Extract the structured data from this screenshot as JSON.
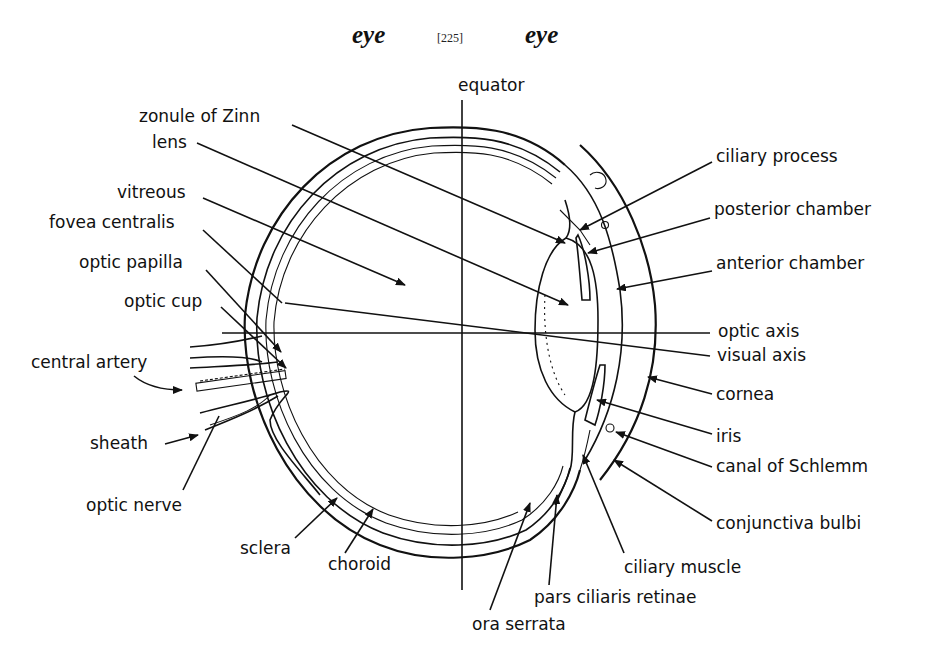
{
  "header": {
    "left_word": "eye",
    "page_number": "[225]",
    "right_word": "eye"
  },
  "diagram": {
    "title_axis_label": "equator",
    "labels_left": {
      "zonule_of_zinn": "zonule of Zinn",
      "lens": "lens",
      "vitreous": "vitreous",
      "fovea_centralis": "fovea centralis",
      "optic_papilla": "optic papilla",
      "optic_cup": "optic cup",
      "central_artery": "central artery",
      "sheath": "sheath",
      "optic_nerve": "optic nerve"
    },
    "labels_bottom": {
      "sclera": "sclera",
      "choroid": "choroid",
      "ora_serrata": "ora serrata",
      "pars_ciliaris_retinae": "pars ciliaris retinae",
      "ciliary_muscle": "ciliary muscle"
    },
    "labels_right": {
      "ciliary_process": "ciliary process",
      "posterior_chamber": "posterior chamber",
      "anterior_chamber": "anterior chamber",
      "optic_axis": "optic axis",
      "visual_axis": "visual axis",
      "cornea": "cornea",
      "iris": "iris",
      "canal_of_schlemm": "canal of Schlemm",
      "conjunctiva_bulbi": "conjunctiva bulbi"
    },
    "colors": {
      "ink": "#111111",
      "paper": "#ffffff"
    }
  }
}
